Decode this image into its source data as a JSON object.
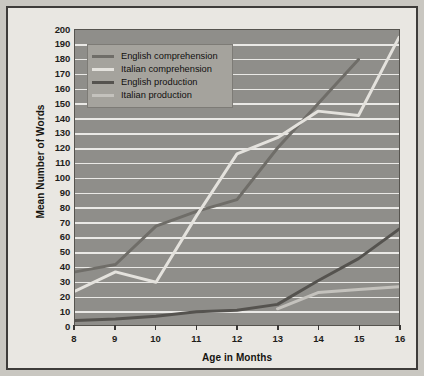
{
  "figure": {
    "background_color": "#c9c7c1",
    "plot_background_color": "#8f8e8a",
    "gridline_color": "#f2f1ee",
    "frame_color": "#3e3c3a"
  },
  "legend": {
    "position": "top-left-inside",
    "background_color": "#a5a39d",
    "entries": [
      {
        "label": "English comprehension",
        "color": "#6f6d68"
      },
      {
        "label": "Italian comprehension",
        "color": "#e4e2dd"
      },
      {
        "label": "English production",
        "color": "#55534f"
      },
      {
        "label": "Italian production",
        "color": "#c4c2bd"
      }
    ]
  },
  "axes": {
    "ylabel": "Mean Number of Words",
    "xlabel": "Age in Months",
    "yticks": [
      200,
      190,
      180,
      170,
      160,
      150,
      140,
      130,
      120,
      110,
      100,
      90,
      80,
      70,
      60,
      50,
      40,
      30,
      20,
      10,
      0
    ],
    "xticks": [
      8,
      9,
      10,
      11,
      12,
      13,
      14,
      15,
      16
    ]
  },
  "chart_data": {
    "type": "line",
    "title": "",
    "xlabel": "Age in Months",
    "ylabel": "Mean Number of Words",
    "x": [
      8,
      9,
      10,
      11,
      12,
      13,
      14,
      15,
      16
    ],
    "xlim": [
      8,
      16
    ],
    "ylim": [
      0,
      200
    ],
    "grid": true,
    "legend_position": "upper left",
    "series": [
      {
        "name": "English comprehension",
        "color": "#6f6d68",
        "x": [
          8,
          9,
          10,
          11,
          12,
          13,
          14,
          15
        ],
        "values": [
          36,
          41,
          67,
          77,
          85,
          120,
          150,
          180
        ]
      },
      {
        "name": "Italian comprehension",
        "color": "#e4e2dd",
        "x": [
          8,
          9,
          10,
          11,
          12,
          13,
          14,
          15,
          16
        ],
        "values": [
          23,
          36,
          29,
          74,
          116,
          127,
          145,
          142,
          195
        ]
      },
      {
        "name": "English production",
        "color": "#55534f",
        "x": [
          8,
          9,
          10,
          11,
          12,
          13,
          14,
          15,
          16
        ],
        "values": [
          3,
          4,
          6,
          9,
          10,
          14,
          30,
          45,
          65
        ]
      },
      {
        "name": "Italian production",
        "color": "#c4c2bd",
        "x": [
          13,
          14,
          15,
          16
        ],
        "values": [
          11,
          22,
          24,
          26
        ]
      }
    ]
  }
}
